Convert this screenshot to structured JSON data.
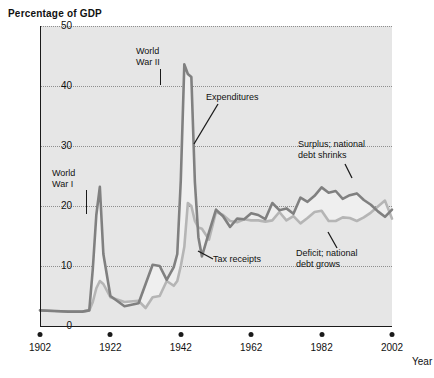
{
  "chart": {
    "title": "Percentage of GDP",
    "xlabel": "Year",
    "ylabel": "",
    "y_ticks": [
      "0",
      "10",
      "20",
      "30",
      "40",
      "50"
    ],
    "x_ticks": [
      "1902",
      "1922",
      "1942",
      "1962",
      "1982",
      "2002"
    ]
  },
  "annotations": [
    {
      "id": "ww1",
      "text": "World\nWar I",
      "line1": "World",
      "line2": "War I"
    },
    {
      "id": "ww2",
      "text": "World\nWar II",
      "line1": "World",
      "line2": "War II"
    },
    {
      "id": "expenditures",
      "line1": "Expenditures",
      "line2": ""
    },
    {
      "id": "tax-receipts",
      "line1": "Tax receipts",
      "line2": ""
    },
    {
      "id": "surplus",
      "line1": "Surplus; national",
      "line2": "debt shrinks"
    },
    {
      "id": "deficit",
      "line1": "Deficit; national",
      "line2": "debt grows"
    }
  ],
  "colors": {
    "expenditures": "#808080",
    "receipts": "#b5b5b5",
    "plot_background": "#e6e6e6",
    "axis": "#1a1a1a",
    "grid": "#8e8e8e",
    "fill": "#efefef"
  },
  "chart_data": {
    "type": "line",
    "title": "Percentage of GDP",
    "xlabel": "Year",
    "ylabel": "Percentage of GDP",
    "xlim": [
      1902,
      2002
    ],
    "ylim": [
      0,
      50
    ],
    "grid": true,
    "legend": "annotations on plot",
    "x": [
      1902,
      1906,
      1910,
      1914,
      1916,
      1917,
      1918,
      1919,
      1920,
      1922,
      1926,
      1930,
      1932,
      1934,
      1936,
      1938,
      1940,
      1941,
      1942,
      1943,
      1944,
      1945,
      1946,
      1947,
      1948,
      1950,
      1952,
      1954,
      1956,
      1958,
      1960,
      1962,
      1964,
      1966,
      1968,
      1970,
      1972,
      1974,
      1976,
      1978,
      1980,
      1982,
      1984,
      1986,
      1988,
      1990,
      1992,
      1994,
      1996,
      1998,
      2000,
      2002
    ],
    "series": [
      {
        "name": "Expenditures",
        "color": "#808080",
        "values": [
          2.6,
          2.5,
          2.4,
          2.4,
          2.6,
          9.5,
          18.5,
          23.2,
          12.0,
          5.0,
          3.3,
          3.8,
          7.0,
          10.2,
          10.0,
          7.7,
          9.8,
          12.0,
          24.3,
          43.6,
          42.0,
          41.5,
          24.0,
          14.8,
          11.6,
          15.6,
          19.4,
          18.3,
          16.5,
          17.9,
          17.8,
          18.8,
          18.5,
          17.8,
          20.5,
          19.3,
          19.6,
          18.7,
          21.4,
          20.7,
          21.7,
          23.1,
          22.2,
          22.5,
          21.2,
          21.8,
          22.1,
          21.0,
          20.2,
          19.1,
          18.2,
          19.4
        ]
      },
      {
        "name": "Tax receipts",
        "color": "#b5b5b5",
        "values": [
          2.6,
          2.5,
          2.4,
          2.4,
          2.6,
          4.0,
          6.3,
          7.5,
          7.0,
          4.8,
          4.0,
          4.2,
          3.0,
          4.8,
          5.0,
          7.5,
          6.7,
          7.5,
          10.0,
          13.2,
          20.5,
          20.0,
          17.5,
          16.4,
          16.2,
          14.4,
          19.0,
          18.5,
          17.5,
          17.3,
          17.8,
          17.6,
          17.6,
          17.4,
          17.6,
          19.0,
          17.6,
          18.3,
          17.1,
          18.0,
          19.0,
          19.2,
          17.5,
          17.5,
          18.1,
          18.0,
          17.5,
          18.1,
          18.9,
          19.9,
          20.9,
          17.9
        ]
      }
    ],
    "annotations": [
      {
        "label": "World War I",
        "x": 1918,
        "y": 23.2
      },
      {
        "label": "World War II",
        "x": 1943,
        "y": 43.6
      },
      {
        "label": "Expenditures",
        "x": 1944,
        "y": 35
      },
      {
        "label": "Tax receipts",
        "x": 1940,
        "y": 7
      },
      {
        "label": "Surplus; national debt shrinks",
        "x": 1999,
        "y": 20
      },
      {
        "label": "Deficit; national debt grows",
        "x": 1990,
        "y": 19
      }
    ]
  }
}
